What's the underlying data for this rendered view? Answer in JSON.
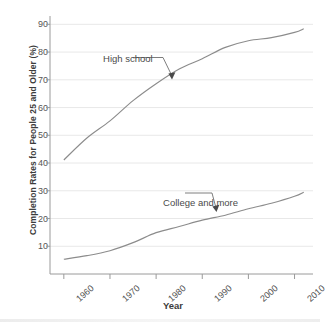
{
  "chart_data": {
    "type": "line",
    "title": "",
    "xlabel": "Year",
    "ylabel": "Completion Rates for People 25 and Older (%)",
    "xlim": [
      1957,
      2014
    ],
    "ylim": [
      0,
      93
    ],
    "grid": true,
    "legend_position": "inline-annotations",
    "x_tick_labels": [
      "1960",
      "1970",
      "1980",
      "1990",
      "2000",
      "2010"
    ],
    "x_ticks": [
      1960,
      1970,
      1980,
      1990,
      2000,
      2010
    ],
    "y_tick_labels": [
      "10",
      "20",
      "30",
      "40",
      "50",
      "60",
      "70",
      "80",
      "90"
    ],
    "y_ticks": [
      10,
      20,
      30,
      40,
      50,
      60,
      70,
      80,
      90
    ],
    "x": [
      1960,
      1965,
      1970,
      1975,
      1980,
      1985,
      1990,
      1995,
      2000,
      2005,
      2010,
      2012
    ],
    "series": [
      {
        "name": "High school",
        "color": "#8c8c8c",
        "values": [
          41.1,
          49.0,
          55.2,
          62.5,
          68.6,
          73.9,
          77.6,
          81.7,
          84.1,
          85.2,
          87.1,
          88.4
        ],
        "annotation": {
          "label": "High school",
          "text_x": 1968.5,
          "text_y": 77.5,
          "arrow_to_x": 1980.0,
          "arrow_to_y": 70.0
        }
      },
      {
        "name": "College and more",
        "color": "#8c8c8c",
        "values": [
          5.3,
          6.6,
          8.4,
          11.3,
          14.9,
          17.1,
          19.4,
          21.2,
          23.5,
          25.5,
          28.0,
          29.5
        ],
        "annotation": {
          "label": "College and more",
          "text_x": 1981.5,
          "text_y": 25.6,
          "arrow_to_x": 1991.5,
          "arrow_to_y": 20.2
        }
      }
    ]
  }
}
